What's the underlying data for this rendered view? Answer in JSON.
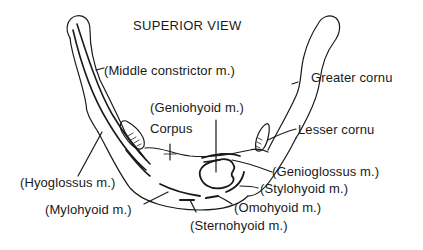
{
  "diagram": {
    "title": "SUPERIOR VIEW",
    "colors": {
      "ink": "#1a1a1a",
      "background": "#ffffff"
    },
    "labels": {
      "middle_constrictor": "(Middle constrictor m.)",
      "greater_cornu": "Greater cornu",
      "geniohyoid": "(Geniohyoid m.)",
      "corpus": "Corpus",
      "lesser_cornu": "Lesser cornu",
      "hyoglossus": "(Hyoglossus m.)",
      "genioglossus": "(Genioglossus m.)",
      "stylohyoid": "(Stylohyoid m.)",
      "mylohyoid": "(Mylohyoid m.)",
      "omohyoid": "(Omohyoid m.)",
      "sternohyoid": "(Sternohyoid m.)"
    }
  }
}
